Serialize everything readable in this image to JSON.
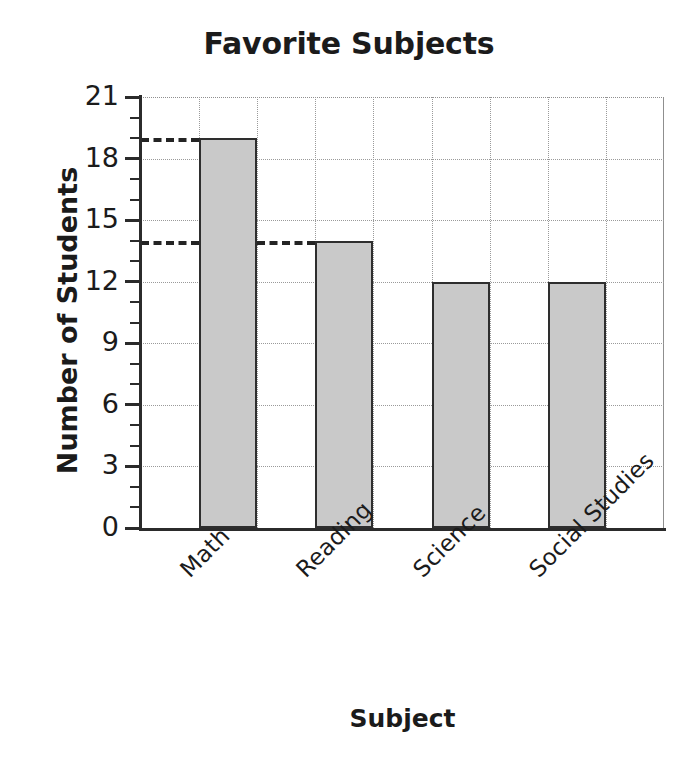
{
  "chart_data": {
    "type": "bar",
    "title": "Favorite Subjects",
    "xlabel": "Subject",
    "ylabel": "Number of Students",
    "categories": [
      "Math",
      "Reading",
      "Science",
      "Social Studies"
    ],
    "values": [
      19,
      14,
      12,
      12
    ],
    "ylim": [
      0,
      21
    ],
    "ytick_labels": [
      "0",
      "3",
      "6",
      "9",
      "12",
      "15",
      "18",
      "21"
    ],
    "ytick_values": [
      0,
      3,
      6,
      9,
      12,
      15,
      18,
      21
    ],
    "minor_tick_step": 1,
    "grid": true,
    "legend": "none",
    "bar_fill_color": "#c9c9c9",
    "bar_edge_color": "#2e2e2e",
    "grid_color": "#9a9a9a",
    "axis_color": "#2b2b2b",
    "text_color": "#1b1b1b",
    "annotations": [
      {
        "name": "leader-line-19",
        "value": 19,
        "style": "dashed",
        "from": "y-axis",
        "to": "Math"
      },
      {
        "name": "leader-line-14",
        "value": 14,
        "style": "dashed",
        "from": "y-axis",
        "to": "Reading"
      }
    ]
  },
  "axis": {
    "y_title": "Number of Students",
    "x_title": "Subject",
    "y_labels": {
      "t0": "0",
      "t3": "3",
      "t6": "6",
      "t9": "9",
      "t12": "12",
      "t15": "15",
      "t18": "18",
      "t21": "21"
    },
    "x_labels": {
      "c0": "Math",
      "c1": "Reading",
      "c2": "Science",
      "c3": "Social Studies"
    }
  },
  "header": {
    "title": "Favorite Subjects"
  }
}
